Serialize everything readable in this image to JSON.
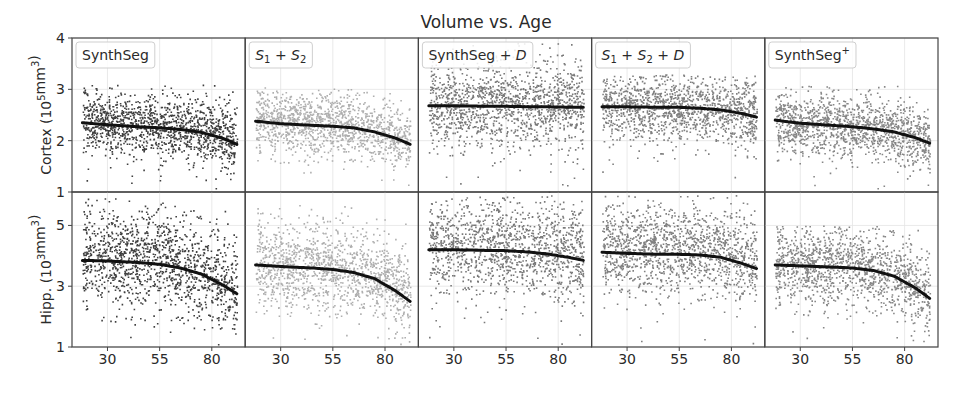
{
  "figure": {
    "title": "Volume vs. Age",
    "width": 969,
    "height": 396
  },
  "chart_data": {
    "type": "scatter",
    "title": "Volume vs. Age",
    "xlabel": "",
    "x_ticks": [
      30,
      55,
      80
    ],
    "xlim": [
      13,
      96
    ],
    "rows": [
      {
        "key": "cortex",
        "ylabel": "Cortex (10^5 mm^3)",
        "ylabel_base": "Cortex (10",
        "ylabel_exp": "5",
        "ylabel_tail": "mm",
        "ylabel_tail_exp": "3",
        "ylim": [
          1,
          4
        ],
        "y_ticks": [
          1,
          2,
          3,
          4
        ]
      },
      {
        "key": "hipp",
        "ylabel": "Hipp. (10^3 mm^3)",
        "ylabel_base": "Hipp. (10",
        "ylabel_exp": "3",
        "ylabel_tail": "mm",
        "ylabel_tail_exp": "3",
        "ylim": [
          1,
          6.1
        ],
        "y_ticks": [
          1,
          3,
          5
        ]
      }
    ],
    "series": [
      {
        "name": "SynthSeg",
        "label_parts": [
          {
            "t": "SynthSeg",
            "i": false
          }
        ],
        "point_color": "#2b2b2b",
        "cortex_trend": {
          "x": [
            18,
            30,
            45,
            55,
            65,
            75,
            85,
            92
          ],
          "y": [
            2.35,
            2.31,
            2.27,
            2.25,
            2.22,
            2.16,
            2.05,
            1.93
          ]
        },
        "hipp_trend": {
          "x": [
            18,
            30,
            45,
            55,
            65,
            75,
            85,
            92
          ],
          "y": [
            3.85,
            3.83,
            3.78,
            3.72,
            3.6,
            3.4,
            3.05,
            2.75
          ]
        },
        "cortex_spread": {
          "center_offset": 0.05,
          "sd": 0.28,
          "min": 1.0,
          "max": 3.1
        },
        "hipp_spread": {
          "center_offset": 0.15,
          "sd": 0.75,
          "min": 1.1,
          "max": 5.9
        }
      },
      {
        "name": "S1 + S2",
        "label_parts": [
          {
            "t": "S",
            "i": true
          },
          {
            "t": "1",
            "sub": true
          },
          {
            "t": " + ",
            "i": false
          },
          {
            "t": "S",
            "i": true
          },
          {
            "t": "2",
            "sub": true
          }
        ],
        "point_color": "#a6a6a6",
        "cortex_trend": {
          "x": [
            18,
            30,
            45,
            55,
            65,
            75,
            85,
            92
          ],
          "y": [
            2.38,
            2.33,
            2.3,
            2.28,
            2.25,
            2.17,
            2.05,
            1.93
          ]
        },
        "hipp_trend": {
          "x": [
            18,
            30,
            45,
            55,
            65,
            75,
            85,
            92
          ],
          "y": [
            3.7,
            3.65,
            3.6,
            3.55,
            3.45,
            3.25,
            2.85,
            2.5
          ]
        },
        "cortex_spread": {
          "center_offset": 0.05,
          "sd": 0.28,
          "min": 1.0,
          "max": 3.05
        },
        "hipp_spread": {
          "center_offset": 0.1,
          "sd": 0.65,
          "min": 1.1,
          "max": 5.7
        }
      },
      {
        "name": "SynthSeg + D",
        "label_parts": [
          {
            "t": "SynthSeg + ",
            "i": false
          },
          {
            "t": "D",
            "i": true
          }
        ],
        "point_color": "#6a6a6a",
        "cortex_trend": {
          "x": [
            18,
            30,
            45,
            55,
            65,
            75,
            85,
            92
          ],
          "y": [
            2.68,
            2.68,
            2.67,
            2.67,
            2.66,
            2.66,
            2.65,
            2.65
          ]
        },
        "hipp_trend": {
          "x": [
            18,
            30,
            45,
            55,
            65,
            75,
            85,
            92
          ],
          "y": [
            4.2,
            4.2,
            4.18,
            4.17,
            4.13,
            4.06,
            3.95,
            3.85
          ]
        },
        "cortex_spread": {
          "center_offset": 0.05,
          "sd": 0.38,
          "min": 1.0,
          "max": 4.0
        },
        "hipp_spread": {
          "center_offset": 0.2,
          "sd": 0.75,
          "min": 1.1,
          "max": 6.0
        }
      },
      {
        "name": "S1 + S2 + D",
        "label_parts": [
          {
            "t": "S",
            "i": true
          },
          {
            "t": "1",
            "sub": true
          },
          {
            "t": " + ",
            "i": false
          },
          {
            "t": "S",
            "i": true
          },
          {
            "t": "2",
            "sub": true
          },
          {
            "t": " + ",
            "i": false
          },
          {
            "t": "D",
            "i": true
          }
        ],
        "point_color": "#727272",
        "cortex_trend": {
          "x": [
            18,
            30,
            45,
            55,
            65,
            75,
            85,
            92
          ],
          "y": [
            2.66,
            2.66,
            2.65,
            2.65,
            2.63,
            2.6,
            2.53,
            2.46
          ]
        },
        "hipp_trend": {
          "x": [
            18,
            30,
            45,
            55,
            65,
            75,
            85,
            92
          ],
          "y": [
            4.12,
            4.08,
            4.05,
            4.05,
            4.03,
            3.95,
            3.75,
            3.58
          ]
        },
        "cortex_spread": {
          "center_offset": 0.05,
          "sd": 0.32,
          "min": 1.0,
          "max": 3.3
        },
        "hipp_spread": {
          "center_offset": 0.2,
          "sd": 0.7,
          "min": 1.1,
          "max": 6.0
        }
      },
      {
        "name": "SynthSeg+",
        "label_parts": [
          {
            "t": "SynthSeg",
            "i": false
          },
          {
            "t": "+",
            "sup": true
          }
        ],
        "point_color": "#7a7a7a",
        "cortex_trend": {
          "x": [
            18,
            30,
            45,
            55,
            65,
            75,
            85,
            92
          ],
          "y": [
            2.4,
            2.34,
            2.3,
            2.27,
            2.23,
            2.17,
            2.06,
            1.95
          ]
        },
        "hipp_trend": {
          "x": [
            18,
            30,
            45,
            55,
            65,
            75,
            85,
            92
          ],
          "y": [
            3.7,
            3.67,
            3.63,
            3.6,
            3.52,
            3.33,
            2.95,
            2.6
          ]
        },
        "cortex_spread": {
          "center_offset": 0.0,
          "sd": 0.27,
          "min": 1.05,
          "max": 3.1
        },
        "hipp_spread": {
          "center_offset": 0.1,
          "sd": 0.6,
          "min": 1.1,
          "max": 5.0
        }
      }
    ],
    "points_per_panel": 1400,
    "age_range": [
      18,
      92
    ],
    "grid": true,
    "legend": "per-panel label box top-left"
  },
  "layout": {
    "plot_left": 72,
    "plot_right": 938,
    "row_tops": [
      38,
      192
    ],
    "row_bottoms": [
      192,
      347
    ],
    "tick_label_y": 364
  }
}
